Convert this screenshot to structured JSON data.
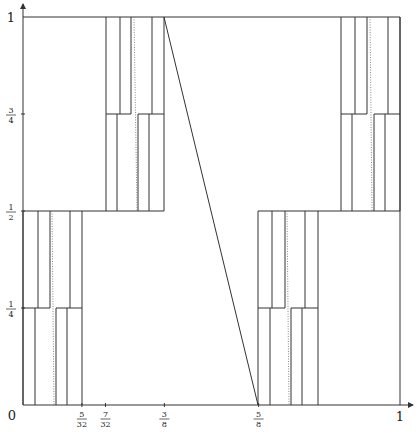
{
  "diagram": {
    "type": "step-function-graph",
    "stroke_color": "#333333",
    "dotted_color": "#888888",
    "axes": {
      "x_label_zero": "0",
      "x_ticks": [
        {
          "num": "5",
          "den": "32",
          "value": 0.15625
        },
        {
          "num": "7",
          "den": "32",
          "value": 0.21875
        },
        {
          "num": "3",
          "den": "8",
          "value": 0.375
        },
        {
          "num": "5",
          "den": "8",
          "value": 0.625
        }
      ],
      "x_label_one": "1",
      "y_ticks": [
        {
          "num": "1",
          "den": "4",
          "value": 0.25
        },
        {
          "num": "1",
          "den": "2",
          "value": 0.5
        },
        {
          "num": "3",
          "den": "4",
          "value": 0.75
        }
      ],
      "y_label_one": "1"
    },
    "frame": {
      "x0": 23,
      "x1": 400,
      "y0": 405,
      "y1": 17
    },
    "blocks": [
      {
        "name": "block-bottom-left",
        "x_left": 23,
        "x_right": 82,
        "y_bottom": 405,
        "y_top": 211,
        "y_mid": 308,
        "upper_verticals": [
          38,
          50,
          70
        ],
        "lower_verticals": [
          35,
          56,
          67
        ],
        "step_left": 50,
        "step_right": 56,
        "mid_segments": [
          [
            23,
            50
          ],
          [
            56,
            82
          ]
        ],
        "dotted": [
          52,
          211,
          54,
          405
        ]
      },
      {
        "name": "block-top-middle",
        "x_left": 106,
        "x_right": 164,
        "y_bottom": 211,
        "y_top": 17,
        "y_mid": 114,
        "upper_verticals": [
          120,
          131,
          152
        ],
        "lower_verticals": [
          117,
          138,
          149
        ],
        "step_left": 131,
        "step_right": 138,
        "mid_segments": [
          [
            106,
            131
          ],
          [
            138,
            164
          ]
        ],
        "dotted": [
          134,
          17,
          137,
          211
        ]
      },
      {
        "name": "block-bottom-right",
        "x_left": 258,
        "x_right": 318,
        "y_bottom": 405,
        "y_top": 211,
        "y_mid": 308,
        "upper_verticals": [
          272,
          285,
          305
        ],
        "lower_verticals": [
          270,
          291,
          302
        ],
        "step_left": 285,
        "step_right": 291,
        "mid_segments": [
          [
            258,
            285
          ],
          [
            291,
            318
          ]
        ],
        "dotted": [
          287,
          211,
          289,
          405
        ]
      },
      {
        "name": "block-top-right",
        "x_left": 341,
        "x_right": 400,
        "y_bottom": 211,
        "y_top": 17,
        "y_mid": 114,
        "upper_verticals": [
          355,
          367,
          388
        ],
        "lower_verticals": [
          352,
          374,
          385
        ],
        "step_left": 367,
        "step_right": 374,
        "mid_segments": [
          [
            341,
            367
          ],
          [
            374,
            400
          ]
        ],
        "dotted": [
          370,
          17,
          372,
          211
        ]
      }
    ],
    "half_lines": [
      {
        "x1": 23,
        "x2": 164,
        "y": 211
      },
      {
        "x1": 258,
        "x2": 400,
        "y": 211
      }
    ],
    "diagonal": {
      "x1": 164,
      "y1": 17,
      "x2": 258,
      "y2": 405
    }
  }
}
